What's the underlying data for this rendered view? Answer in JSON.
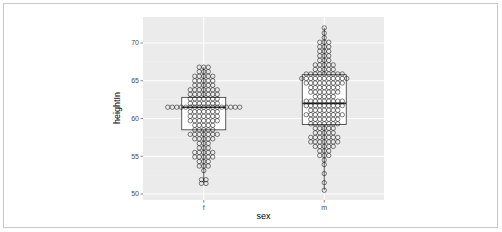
{
  "chart_data": {
    "type": "dotplot+boxplot",
    "title": "",
    "xlabel": "sex",
    "ylabel": "heightIn",
    "categories": [
      "f",
      "m"
    ],
    "ylim": [
      49.2,
      73.3
    ],
    "yticks": [
      50,
      55,
      60,
      65,
      70
    ],
    "grid": true,
    "legend": "none",
    "boxplots": [
      {
        "category": "f",
        "min": 51.5,
        "q1": 58.5,
        "median": 61.5,
        "q3": 62.8,
        "max": 66.8
      },
      {
        "category": "m",
        "min": 50.5,
        "q1": 59.2,
        "median": 62.0,
        "q3": 65.8,
        "max": 72.0
      }
    ],
    "dots": [
      {
        "category": "f",
        "rows": [
          [
            66.8,
            3
          ],
          [
            66.2,
            3
          ],
          [
            65.6,
            5
          ],
          [
            65.0,
            5
          ],
          [
            64.4,
            5
          ],
          [
            63.8,
            7
          ],
          [
            63.2,
            7
          ],
          [
            62.6,
            7
          ],
          [
            62.0,
            7
          ],
          [
            61.5,
            17
          ],
          [
            60.9,
            7
          ],
          [
            60.3,
            7
          ],
          [
            59.7,
            7
          ],
          [
            59.1,
            5
          ],
          [
            58.5,
            5
          ],
          [
            57.9,
            7
          ],
          [
            57.3,
            5
          ],
          [
            56.7,
            3
          ],
          [
            56.1,
            3
          ],
          [
            55.5,
            5
          ],
          [
            54.9,
            5
          ],
          [
            54.3,
            3
          ],
          [
            53.7,
            3
          ],
          [
            53.1,
            1
          ],
          [
            51.9,
            2
          ],
          [
            51.4,
            2
          ]
        ]
      },
      {
        "category": "m",
        "rows": [
          [
            72.0,
            1
          ],
          [
            71.3,
            1
          ],
          [
            70.7,
            1
          ],
          [
            70.1,
            3
          ],
          [
            69.5,
            3
          ],
          [
            68.9,
            3
          ],
          [
            68.3,
            3
          ],
          [
            67.7,
            3
          ],
          [
            67.1,
            5
          ],
          [
            66.5,
            5
          ],
          [
            65.9,
            9
          ],
          [
            65.3,
            11
          ],
          [
            64.7,
            9
          ],
          [
            64.1,
            7
          ],
          [
            63.5,
            7
          ],
          [
            62.9,
            5
          ],
          [
            62.3,
            9
          ],
          [
            61.7,
            9
          ],
          [
            61.1,
            7
          ],
          [
            60.5,
            9
          ],
          [
            59.9,
            7
          ],
          [
            59.3,
            7
          ],
          [
            58.7,
            5
          ],
          [
            58.1,
            5
          ],
          [
            57.5,
            7
          ],
          [
            56.9,
            7
          ],
          [
            56.3,
            5
          ],
          [
            55.7,
            3
          ],
          [
            55.1,
            3
          ],
          [
            54.5,
            1
          ],
          [
            53.9,
            1
          ],
          [
            52.7,
            1
          ],
          [
            51.5,
            1
          ],
          [
            50.5,
            1
          ]
        ]
      }
    ]
  },
  "colors": {
    "panel_bg": "#ebebeb",
    "grid_major": "#ffffff",
    "grid_minor": "#f5f5f5",
    "box_fill": "#ffffff",
    "box_stroke": "#333333",
    "dot_stroke": "#000000",
    "dot_fill": "none"
  }
}
